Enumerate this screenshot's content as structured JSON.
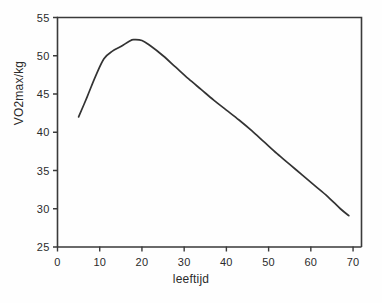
{
  "chart_data": {
    "type": "line",
    "title": "",
    "xlabel": "leeftijd",
    "ylabel": "VO2max/kg",
    "xlim": [
      0,
      72
    ],
    "ylim": [
      25,
      55
    ],
    "grid": false,
    "legend": "none",
    "xticks": [
      "0",
      "10",
      "20",
      "30",
      "40",
      "50",
      "60",
      "70"
    ],
    "xtick_values": [
      0,
      10,
      20,
      30,
      40,
      50,
      60,
      70
    ],
    "yticks": [
      "25",
      "30",
      "35",
      "40",
      "45",
      "50",
      "55"
    ],
    "ytick_values": [
      25,
      30,
      35,
      40,
      45,
      50,
      55
    ],
    "series": [
      {
        "name": "VO2max/kg vs leeftijd",
        "color": "#333333",
        "x": [
          5,
          7,
          9,
          11,
          13,
          15,
          17,
          18,
          20,
          22,
          25,
          28,
          31,
          34,
          37,
          40,
          43,
          46,
          49,
          52,
          55,
          58,
          61,
          64,
          67,
          69
        ],
        "y": [
          42.0,
          44.6,
          47.3,
          49.6,
          50.6,
          51.2,
          51.9,
          52.1,
          52.0,
          51.3,
          50.0,
          48.5,
          47.0,
          45.6,
          44.2,
          42.9,
          41.6,
          40.2,
          38.7,
          37.2,
          35.8,
          34.4,
          33.0,
          31.6,
          30.0,
          29.1
        ]
      }
    ]
  },
  "axes": {
    "yaxis_title": "VO2max/kg",
    "xaxis_title": "leeftijd"
  },
  "colors": {
    "line": "#333333",
    "frame": "#3a3a3a",
    "text": "#2b2b2b",
    "background": "#fefefe"
  }
}
